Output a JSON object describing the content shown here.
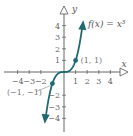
{
  "chart_data": {
    "type": "line",
    "title": "",
    "xlabel": "x",
    "ylabel": "y",
    "function_label": "f(x) = x³",
    "xlim": [
      -4.5,
      5
    ],
    "ylim": [
      -4.5,
      5
    ],
    "x_ticks": [
      -4,
      -3,
      -2,
      1,
      2,
      3,
      4
    ],
    "x_tick_labels": [
      "−4",
      "−3",
      "−2",
      "1",
      "2",
      "3",
      "4"
    ],
    "y_ticks": [
      4,
      3,
      2,
      1,
      -2,
      -3,
      -4
    ],
    "y_tick_labels": [
      "4",
      "3",
      "2",
      "1",
      "−2",
      "−3",
      "−4"
    ],
    "grid": false,
    "series": [
      {
        "name": "f(x) = x³",
        "color": "#1f6b70",
        "x": [
          -1.6,
          -1.4,
          -1.2,
          -1,
          -0.8,
          -0.6,
          -0.4,
          -0.2,
          0,
          0.2,
          0.4,
          0.6,
          0.8,
          1,
          1.2,
          1.4,
          1.6
        ],
        "y": [
          -4.096,
          -2.744,
          -1.728,
          -1,
          -0.512,
          -0.216,
          -0.064,
          -0.008,
          0,
          0.008,
          0.064,
          0.216,
          0.512,
          1,
          1.728,
          2.744,
          4.096
        ]
      }
    ],
    "points": [
      {
        "x": 1,
        "y": 1,
        "label": "(1, 1)"
      },
      {
        "x": -1,
        "y": -1,
        "label": "(−1, −1)"
      }
    ],
    "colors": {
      "curve": "#1f6b70",
      "axis": "#666666"
    }
  }
}
